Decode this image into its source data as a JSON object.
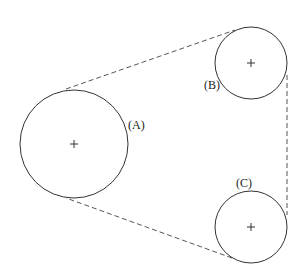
{
  "diagram": {
    "type": "belt-pulley",
    "pulleys": [
      {
        "id": "A",
        "label": "(A)",
        "cx": 74,
        "cy": 144,
        "r": 54,
        "label_x": 128,
        "label_y": 129
      },
      {
        "id": "B",
        "label": "(B)",
        "cx": 251,
        "cy": 63,
        "r": 36,
        "label_x": 204,
        "label_y": 89
      },
      {
        "id": "C",
        "label": "(C)",
        "cx": 251,
        "cy": 227,
        "r": 36,
        "label_x": 236,
        "label_y": 187
      }
    ],
    "belt_segments": [
      {
        "from": "A",
        "to": "B",
        "x1": 66,
        "y1": 89,
        "x2": 235,
        "y2": 30
      },
      {
        "from": "B",
        "to": "C",
        "x1": 287,
        "y1": 75,
        "x2": 287,
        "y2": 215
      },
      {
        "from": "C",
        "to": "A",
        "x1": 232,
        "y1": 258,
        "x2": 66,
        "y2": 198
      }
    ],
    "colors": {
      "stroke": "#333333",
      "belt": "#555555",
      "background": "#ffffff"
    }
  }
}
